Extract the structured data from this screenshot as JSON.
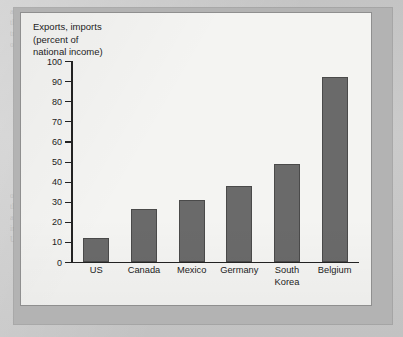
{
  "figure": {
    "title_lines": [
      "Exports, imports",
      "(percent of",
      "national income)"
    ],
    "title_text": "Exports, imports\n(percent of\nnational income)"
  },
  "colors": {
    "bar_fill": "#6a6a6a",
    "bar_outline": "#4a4a4a",
    "axis": "#232323",
    "panel_background": "#f4f4f2",
    "page_background": "#c4c4c4",
    "shadow_band": "#b3b3b3"
  },
  "ghost_text": {
    "col1": "a dominant trend b. sublished in a superior in the magnitude of a different statistics of the trade to persist changes in the state on the official and full policy considerations with",
    "col2": "The Gains from Trade In a trade, they aroused indexes and indifferent findings that somewhat stable traditions in trade but measure the burden of an ultimate for the trade and Pareto gain of a state could exist in a",
    "col3": "over the international trade in the interest of in the same with a state in the trade across this is a major in the trade and the policy could exist in trade of a country to produce more of every Union",
    "col4": "factually obtained over the trade is a political trade distinction in a positive"
  },
  "chart_data": {
    "type": "bar",
    "title": "Exports, imports (percent of national income)",
    "xlabel": "",
    "ylabel": "Exports, imports (percent of national income)",
    "categories": [
      "US",
      "Canada",
      "Mexico",
      "Germany",
      "South\nKorea",
      "Belgium"
    ],
    "values": [
      12,
      26.5,
      31,
      38,
      49,
      92
    ],
    "ylim": [
      0,
      100
    ],
    "ytick_step": 10,
    "yticks": [
      0,
      10,
      20,
      30,
      40,
      50,
      60,
      70,
      80,
      90,
      100
    ],
    "ytick_labels": [
      "0",
      "10",
      "20",
      "30",
      "40",
      "50",
      "60",
      "70",
      "80",
      "90",
      "100"
    ],
    "grid": false,
    "legend": false,
    "series": [
      {
        "name": "Exports, imports (percent of national income)",
        "values": [
          12,
          26.5,
          31,
          38,
          49,
          92
        ]
      }
    ]
  }
}
